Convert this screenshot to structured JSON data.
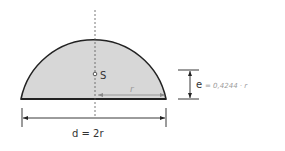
{
  "diagram": {
    "shape": "semicircle",
    "fill_color": "#d7d7d7",
    "stroke_color": "#222222",
    "centroid_label": "S",
    "radius_label": "r",
    "diameter_label": "d = 2r",
    "eccentricity_label": "e",
    "eccentricity_value": "= 0,4244 · r"
  }
}
